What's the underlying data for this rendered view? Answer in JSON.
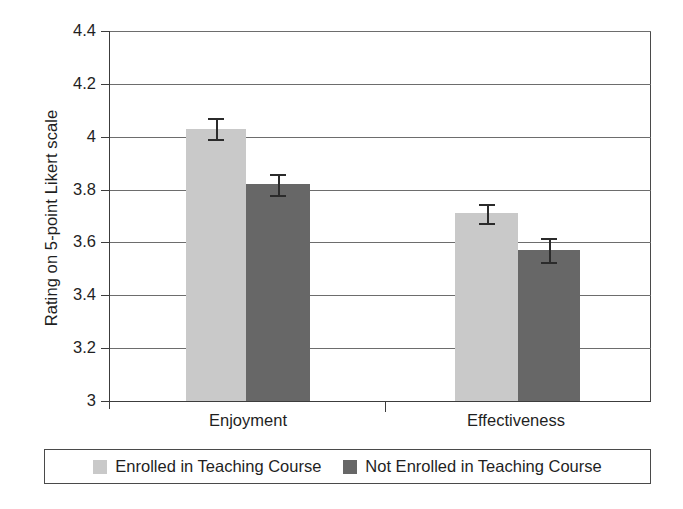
{
  "chart_data": {
    "type": "bar",
    "title": "",
    "xlabel": "",
    "ylabel": "Rating on 5-point Likert scale",
    "categories": [
      "Enjoyment",
      "Effectiveness"
    ],
    "ylim": [
      3,
      4.4
    ],
    "yticks": [
      "3",
      "3.2",
      "3.4",
      "3.6",
      "3.8",
      "4",
      "4.2",
      "4.4"
    ],
    "ytick_values": [
      3,
      3.2,
      3.4,
      3.6,
      3.8,
      4,
      4.2,
      4.4
    ],
    "grid": true,
    "legend_position": "bottom",
    "series": [
      {
        "name": "Enrolled in Teaching Course",
        "color": "#c9c9c9",
        "values": [
          4.03,
          3.71
        ],
        "errors": [
          0.04,
          0.035
        ]
      },
      {
        "name": "Not Enrolled in Teaching Course",
        "color": "#676767",
        "values": [
          3.82,
          3.57
        ],
        "errors": [
          0.04,
          0.045
        ]
      }
    ]
  },
  "colors": {
    "series_light": "#c9c9c9",
    "series_dark": "#676767",
    "axis": "#3c3c3c",
    "grid": "#6d6d6d",
    "text": "#1f1f1f",
    "background": "#ffffff"
  },
  "axis": {
    "y_title": "Rating on 5-point Likert scale"
  },
  "legend": {
    "items": [
      {
        "label": "Enrolled in Teaching Course",
        "swatch": "light-gray-swatch"
      },
      {
        "label": "Not Enrolled in Teaching Course",
        "swatch": "dark-gray-swatch"
      }
    ]
  }
}
